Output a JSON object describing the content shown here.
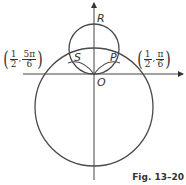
{
  "figure": {
    "caption": "Fig. 13–20",
    "stroke_color": "#4a4a4a",
    "axes": {
      "origin": [
        94,
        74
      ],
      "x_axis": {
        "from": 23,
        "to": 183
      },
      "y_axis": {
        "from": 180,
        "to": 2
      }
    },
    "curves": [
      {
        "name": "small-circle",
        "cx": 94,
        "cy": 49,
        "r": 25
      },
      {
        "name": "large-circle",
        "cx": 94,
        "cy": 107,
        "r": 59
      }
    ],
    "points": {
      "R": "R",
      "S": "S",
      "P": "P",
      "O": "O"
    },
    "left_coord": {
      "r_num": "1",
      "r_den": "2",
      "theta_num": "5π",
      "theta_den": "6"
    },
    "right_coord": {
      "r_num": "1",
      "r_den": "2",
      "theta_num": "π",
      "theta_den": "6"
    }
  }
}
